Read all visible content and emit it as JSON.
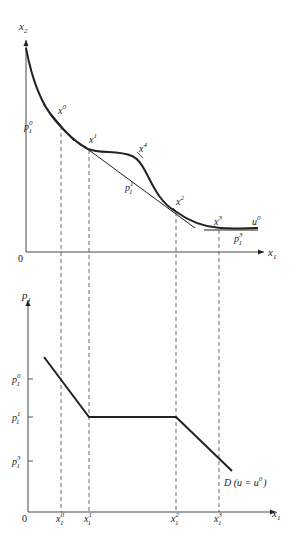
{
  "figure": {
    "type": "economics-diagram",
    "top_panel": {
      "y_axis_label": "x",
      "y_axis_sub": "2",
      "x_axis_label": "x",
      "x_axis_sub": "1",
      "origin": "0",
      "curve_label": "u",
      "curve_label_sup": "0",
      "points": [
        {
          "name": "x",
          "sup": "0"
        },
        {
          "name": "x",
          "sup": "1"
        },
        {
          "name": "x",
          "sup": "4"
        },
        {
          "name": "x",
          "sup": "2"
        },
        {
          "name": "x",
          "sup": "3"
        }
      ],
      "price_lines": [
        {
          "name": "p",
          "sub": "1",
          "sup": "0"
        },
        {
          "name": "p",
          "sub": "1",
          "sup": "1"
        },
        {
          "name": "p",
          "sub": "1",
          "sup": "3"
        }
      ]
    },
    "bottom_panel": {
      "y_axis_label": "p",
      "y_axis_sub": "1",
      "x_axis_label": "x",
      "x_axis_sub": "1",
      "origin": "0",
      "y_ticks": [
        {
          "name": "p",
          "sub": "1",
          "sup": "0"
        },
        {
          "name": "p",
          "sub": "1",
          "sup": "1"
        },
        {
          "name": "p",
          "sub": "1",
          "sup": "3"
        }
      ],
      "x_ticks": [
        {
          "name": "x",
          "sub": "1",
          "sup": "0"
        },
        {
          "name": "x",
          "sub": "1",
          "sup": "1"
        },
        {
          "name": "x",
          "sub": "1",
          "sup": "2"
        },
        {
          "name": "x",
          "sub": "1",
          "sup": "3"
        }
      ],
      "demand_label": "D (u = u",
      "demand_label_sup": "0",
      "demand_label_end": ")"
    }
  }
}
